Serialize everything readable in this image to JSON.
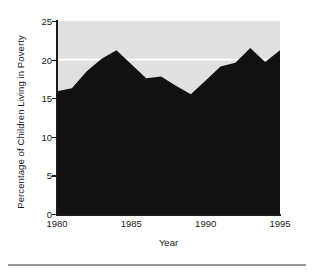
{
  "chart_data": {
    "type": "area",
    "title": "",
    "xlabel": "Year",
    "ylabel": "Percentage of Children Living in Poverty",
    "xlim": [
      1980,
      1995
    ],
    "ylim": [
      0,
      25
    ],
    "xticks": [
      1980,
      1985,
      1990,
      1995
    ],
    "xtick_labels": [
      "1980",
      "1985",
      "1990",
      "1995"
    ],
    "yticks": [
      0,
      5,
      10,
      15,
      20,
      25
    ],
    "ytick_labels": [
      "0",
      "5",
      "10",
      "15",
      "20",
      "25"
    ],
    "grid": "horizontal white line at y=20",
    "gridlines": [
      20
    ],
    "legend": "none",
    "fill_color": "#111111",
    "plot_background": "#e0e0e0",
    "gridline_color": "#ffffff",
    "x": [
      1980,
      1981,
      1982,
      1983,
      1984,
      1985,
      1986,
      1987,
      1988,
      1989,
      1990,
      1991,
      1992,
      1993,
      1994,
      1995
    ],
    "values": [
      15.9,
      16.3,
      18.5,
      20.1,
      21.2,
      19.4,
      17.6,
      17.8,
      16.6,
      15.5,
      17.3,
      19.1,
      19.6,
      21.5,
      19.7,
      21.2
    ],
    "series": [
      {
        "name": "Percentage of Children Living in Poverty",
        "values": [
          15.9,
          16.3,
          18.5,
          20.1,
          21.2,
          19.4,
          17.6,
          17.8,
          16.6,
          15.5,
          17.3,
          19.1,
          19.6,
          21.5,
          19.7,
          21.2
        ]
      }
    ]
  },
  "axis": {
    "y_title": "Percentage of Children Living in Poverty",
    "x_title": "Year"
  }
}
